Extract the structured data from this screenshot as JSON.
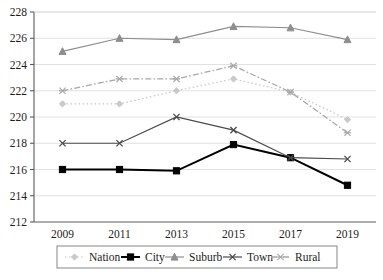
{
  "chart_data": {
    "type": "line",
    "title": "",
    "xlabel": "",
    "ylabel": "",
    "categories": [
      "2009",
      "2011",
      "2013",
      "2015",
      "2017",
      "2019"
    ],
    "ylim": [
      212,
      228
    ],
    "yticks": [
      212,
      214,
      216,
      218,
      220,
      222,
      224,
      226,
      228
    ],
    "grid": true,
    "legend_position": "bottom",
    "series": [
      {
        "name": "Nation",
        "values": [
          221,
          221,
          222,
          222.9,
          221.9,
          219.8
        ],
        "color": "#c9c9c9",
        "marker": "diamond",
        "dash": "dotted",
        "width": 1.2
      },
      {
        "name": "City",
        "values": [
          216,
          216,
          215.9,
          217.9,
          216.9,
          214.8
        ],
        "color": "#000000",
        "marker": "square",
        "dash": "solid",
        "width": 2.0
      },
      {
        "name": "Suburb",
        "values": [
          225,
          226,
          225.9,
          226.9,
          226.8,
          225.9
        ],
        "color": "#8e8e8e",
        "marker": "triangle",
        "dash": "solid",
        "width": 1.2
      },
      {
        "name": "Town",
        "values": [
          218,
          218,
          220,
          219,
          216.9,
          216.8
        ],
        "color": "#4a4a4a",
        "marker": "x",
        "dash": "solid",
        "width": 1.2
      },
      {
        "name": "Rural",
        "values": [
          222,
          222.9,
          222.9,
          223.9,
          221.9,
          218.8
        ],
        "color": "#a8a8a8",
        "marker": "asterisk",
        "dash": "dashdot",
        "width": 1.3
      }
    ]
  },
  "legend": {
    "items": [
      {
        "label": "Nation"
      },
      {
        "label": "City"
      },
      {
        "label": "Suburb"
      },
      {
        "label": "Town"
      },
      {
        "label": "Rural"
      }
    ]
  }
}
